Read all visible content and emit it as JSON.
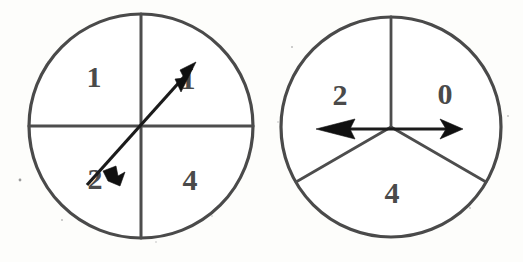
{
  "figure": {
    "background_color": "#fdfdfb",
    "ink_color": "#4a4a4a",
    "pointer_color": "#101010",
    "spinners": [
      {
        "id": "left-spinner",
        "name": "four-sector-spinner",
        "center": {
          "x": 141,
          "y": 126
        },
        "radius": 112,
        "sector_count": 4,
        "divider_angles_deg": [
          0,
          90,
          180,
          270
        ],
        "pointer": {
          "type": "double-headed-arrow",
          "angle_deg": 48,
          "primary_direction": "northeast",
          "secondary_direction": "southwest",
          "length": 104
        },
        "sectors": [
          {
            "label": "1",
            "position": "upper-left",
            "label_x": 94,
            "label_y": 80,
            "start_deg": 90,
            "end_deg": 180
          },
          {
            "label": "1",
            "position": "upper-right",
            "label_x": 188,
            "label_y": 82,
            "start_deg": 0,
            "end_deg": 90
          },
          {
            "label": "2",
            "position": "lower-left",
            "label_x": 95,
            "label_y": 182,
            "start_deg": 180,
            "end_deg": 270
          },
          {
            "label": "4",
            "position": "lower-right",
            "label_x": 190,
            "label_y": 183,
            "start_deg": 270,
            "end_deg": 360
          }
        ]
      },
      {
        "id": "right-spinner",
        "name": "three-sector-spinner",
        "center": {
          "x": 391,
          "y": 127
        },
        "radius": 110,
        "sector_count": 3,
        "divider_angles_deg": [
          90,
          210,
          330
        ],
        "pointer": {
          "type": "double-headed-arrow",
          "angle_deg": 180,
          "primary_direction": "west",
          "secondary_direction": "east",
          "length": 96
        },
        "sectors": [
          {
            "label": "2",
            "position": "upper-left",
            "label_x": 340,
            "label_y": 98,
            "start_deg": 90,
            "end_deg": 210
          },
          {
            "label": "0",
            "position": "upper-right",
            "label_x": 445,
            "label_y": 97,
            "start_deg": 330,
            "end_deg": 450
          },
          {
            "label": "4",
            "position": "bottom",
            "label_x": 392,
            "label_y": 196,
            "start_deg": 210,
            "end_deg": 330
          }
        ]
      }
    ]
  }
}
